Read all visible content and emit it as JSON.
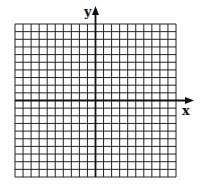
{
  "figure": {
    "type": "coordinate-grid",
    "x_axis_label": "x",
    "y_axis_label": "y",
    "grid": {
      "columns": 20,
      "rows": 20,
      "left_of_y_axis": 10,
      "above_x_axis": 10
    },
    "colors": {
      "grid_line": "#222222",
      "axis": "#111111",
      "background": "#ffffff"
    }
  }
}
